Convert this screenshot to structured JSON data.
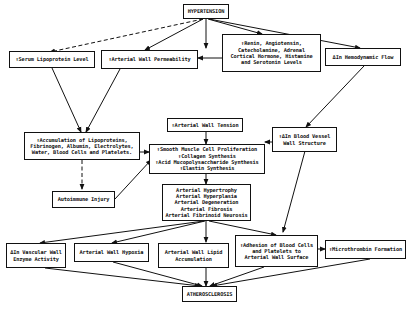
{
  "diagram": {
    "type": "flowchart",
    "colors": {
      "line": "#111111",
      "background": "#ffffff",
      "box_border": "#111111"
    },
    "nodes": {
      "hypertension": "HYPERTENSION",
      "serum_lipoprotein": "↑Serum Lipoprotein Level",
      "arterial_wall_permeability": "↑Arterial Wall Permeability",
      "renin_levels": "↑Renin, Angiotensin,\nCatecholamine, Adrenal\nCortical Hormone, Histamine\nand Serotonin Levels",
      "hemodynamic_flow": "ΔIn Hemodynamic Flow",
      "arterial_wall_tension": "↑Arterial Wall Tension",
      "accumulation": "↑Accumulation of Lipoproteins,\nFibrinogen, Albumin, Electrolytes,\nWater, Blood Cells and Platelets.",
      "smooth_muscle": "↑Smooth Muscle Cell Proliferation\n↑Collagen Synthesis\n↑Acid Mucopolysaccharide Synthesis\n↑Elastin Synthesis",
      "blood_vessel_wall": "↑ΔIn Blood Vessel\nWall Structure",
      "autoimmune_injury": "Autoimmune Injury",
      "arterial_changes": "Arterial Hypertrophy\nArterial Hyperplasia\nArterial Degeneration\nArterial Fibrosis\nArterial Fibrinoid Neurosis",
      "vascular_enzyme": "ΔIn Vascular Wall\nEnzyme Activity",
      "arterial_hypoxia": "Arterial Wall Hypoxia",
      "lipid_accumulation": "Arterial Wall Lipid\nAccumulation",
      "adhesion": "↑Adhesion of Blood Cells\nand Platelets to\nArterial Wall Surface",
      "microthrombin": "↑Microthrombin Formation",
      "atherosclerosis": "ATHEROSCLEROSIS"
    },
    "edges": [
      {
        "from": "hypertension",
        "to": "serum_lipoprotein",
        "style": "dashed"
      },
      {
        "from": "hypertension",
        "to": "arterial_wall_permeability",
        "style": "solid"
      },
      {
        "from": "hypertension",
        "to": "renin_levels",
        "style": "solid"
      },
      {
        "from": "hypertension",
        "to": "hemodynamic_flow",
        "style": "solid"
      },
      {
        "from": "renin_levels",
        "to": "arterial_wall_permeability",
        "style": "solid"
      },
      {
        "from": "serum_lipoprotein",
        "to": "accumulation",
        "style": "solid"
      },
      {
        "from": "arterial_wall_permeability",
        "to": "accumulation",
        "style": "solid"
      },
      {
        "from": "hemodynamic_flow",
        "to": "blood_vessel_wall",
        "style": "solid"
      },
      {
        "from": "arterial_wall_tension",
        "to": "smooth_muscle",
        "style": "solid"
      },
      {
        "from": "accumulation",
        "to": "smooth_muscle",
        "style": "solid"
      },
      {
        "from": "blood_vessel_wall",
        "to": "smooth_muscle",
        "style": "solid"
      },
      {
        "from": "accumulation",
        "to": "autoimmune_injury",
        "style": "dashed"
      },
      {
        "from": "autoimmune_injury",
        "to": "smooth_muscle",
        "style": "solid"
      },
      {
        "from": "smooth_muscle",
        "to": "arterial_changes",
        "style": "solid"
      },
      {
        "from": "blood_vessel_wall",
        "to": "adhesion",
        "style": "solid"
      },
      {
        "from": "arterial_changes",
        "to": "vascular_enzyme",
        "style": "solid"
      },
      {
        "from": "arterial_changes",
        "to": "arterial_hypoxia",
        "style": "solid"
      },
      {
        "from": "arterial_changes",
        "to": "lipid_accumulation",
        "style": "solid"
      },
      {
        "from": "arterial_changes",
        "to": "adhesion",
        "style": "solid"
      },
      {
        "from": "adhesion",
        "to": "microthrombin",
        "style": "solid"
      },
      {
        "from": "vascular_enzyme",
        "to": "atherosclerosis",
        "style": "solid"
      },
      {
        "from": "arterial_hypoxia",
        "to": "atherosclerosis",
        "style": "solid"
      },
      {
        "from": "lipid_accumulation",
        "to": "atherosclerosis",
        "style": "solid"
      },
      {
        "from": "adhesion",
        "to": "atherosclerosis",
        "style": "solid"
      },
      {
        "from": "microthrombin",
        "to": "atherosclerosis",
        "style": "solid"
      }
    ]
  }
}
